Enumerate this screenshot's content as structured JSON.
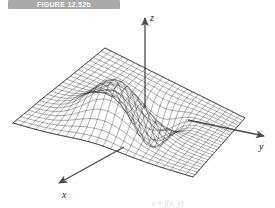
{
  "figure": {
    "banner_label": "FIGURE 12.52b",
    "banner_color": "#a9a9a9",
    "banner_text_color": "#ffffff",
    "background_color": "#ffffff",
    "bottom_partial_caption": "z = f(x, y)"
  },
  "axes": {
    "z_label": "z",
    "y_label": "y",
    "x_label": "x",
    "axis_color": "#4a4a4a"
  },
  "chart_data": {
    "type": "surface",
    "title": "FIGURE 12.52b",
    "xlabel": "x",
    "ylabel": "y",
    "zlabel": "z",
    "grid": true,
    "legend": "none",
    "mesh": {
      "u_divisions": 24,
      "v_divisions": 24,
      "line_color": "#1f1f1f",
      "face_color": "#ffffff"
    },
    "projection": {
      "plane_corners_px": {
        "left": [
          13,
          123
        ],
        "top": [
          105,
          48
        ],
        "right": [
          245,
          118
        ],
        "bottom": [
          193,
          177
        ]
      },
      "z_scale_px_per_unit": 46
    },
    "axis_arrows_px": {
      "z": {
        "from": [
          145,
          103
        ],
        "to": [
          145,
          14
        ]
      },
      "y": {
        "from": [
          186,
          118
        ],
        "to": [
          265,
          137
        ]
      },
      "x": {
        "from": [
          125,
          148
        ],
        "to": [
          57,
          185
        ]
      }
    },
    "features": [
      {
        "name": "peak",
        "kind": "maximum",
        "center_uv": [
          0.33,
          0.45
        ],
        "amplitude": 1.0,
        "sigma": 0.15,
        "description": "rounded Gaussian hill rising above the base plane"
      },
      {
        "name": "well",
        "kind": "minimum",
        "center_uv": [
          0.6,
          0.52
        ],
        "amplitude": -0.95,
        "sigma": 0.11,
        "description": "deep circular depression dipping below the base plane"
      }
    ],
    "surface_function": "z = exp(-a((u-u1)^2+(v-v1)^2)) - exp(-b((u-u2)^2+(v-v2)^2))",
    "zlim": [
      -1,
      1
    ]
  }
}
